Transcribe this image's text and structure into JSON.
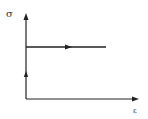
{
  "diagram": {
    "type": "stress-strain curve (rigid-perfectly plastic)",
    "y_axis_label": "σ",
    "x_axis_label": "ε",
    "path": [
      {
        "from": "origin",
        "to": "yield point",
        "direction": "up"
      },
      {
        "from": "yield point",
        "to": "end",
        "direction": "right"
      }
    ],
    "colors": {
      "line": "#222222",
      "background": "#ffffff"
    }
  }
}
